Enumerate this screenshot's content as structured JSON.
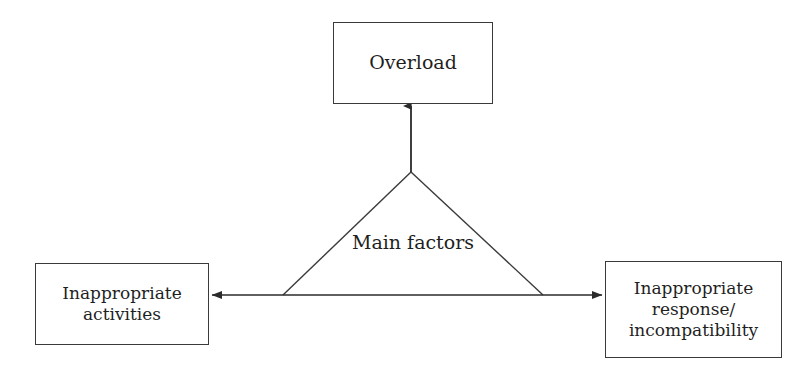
{
  "diagram": {
    "title": "Main factors",
    "background_color": "#ffffff",
    "line_color": "#3a3a3a",
    "text_color": "#1f1f1f",
    "center_label": "Main factors",
    "nodes": [
      {
        "id": "overload",
        "label": "Overload",
        "position": "top-center"
      },
      {
        "id": "inappropriate-activities",
        "label": "Inappropriate\nactivities",
        "position": "bottom-left"
      },
      {
        "id": "inappropriate-response",
        "label": "Inappropriate\nresponse/\nincompatibility",
        "position": "bottom-right"
      }
    ],
    "connectors": [
      {
        "id": "apex-to-overload",
        "from": "triangle-apex",
        "to": "overload",
        "arrowheads": "end",
        "direction": "up"
      },
      {
        "id": "activities-to-response",
        "from": "inappropriate-activities",
        "to": "inappropriate-response",
        "arrowheads": "both",
        "direction": "horizontal"
      }
    ],
    "triangle": {
      "apex": [
        411,
        171
      ],
      "base_left": [
        283,
        295
      ],
      "base_right": [
        543,
        295
      ]
    }
  }
}
